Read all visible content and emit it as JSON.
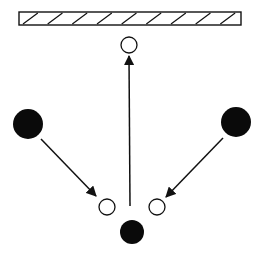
{
  "diagram": {
    "colors": {
      "stroke": "#111111",
      "fill_dark": "#0a0a0a",
      "background": "#ffffff"
    },
    "barrier": {
      "label": "",
      "x": 19,
      "y": 12,
      "width": 222,
      "height": 13,
      "hatch_count": 9
    },
    "filled_circles": [
      {
        "id": "left-player",
        "cx": 28,
        "cy": 124,
        "r": 15
      },
      {
        "id": "right-player",
        "cx": 236,
        "cy": 122,
        "r": 15
      },
      {
        "id": "bottom-player",
        "cx": 132,
        "cy": 232,
        "r": 12
      }
    ],
    "open_circles": [
      {
        "id": "top-target",
        "cx": 129,
        "cy": 45,
        "r": 8
      },
      {
        "id": "left-target",
        "cx": 107,
        "cy": 207,
        "r": 8
      },
      {
        "id": "right-target",
        "cx": 157,
        "cy": 207,
        "r": 8
      }
    ],
    "arrows": [
      {
        "id": "left-arrow",
        "x1": 41,
        "y1": 139,
        "x2": 96,
        "y2": 196
      },
      {
        "id": "right-arrow",
        "x1": 223,
        "y1": 138,
        "x2": 166,
        "y2": 197
      },
      {
        "id": "center-arrow",
        "x1": 130,
        "y1": 206,
        "x2": 129,
        "y2": 56
      }
    ]
  }
}
